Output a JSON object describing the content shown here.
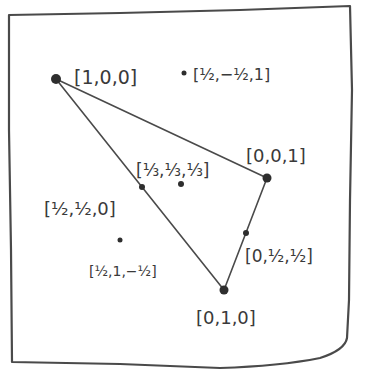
{
  "diagram": {
    "type": "projective-plane-triangle-sketch",
    "style": "hand-drawn",
    "colors": {
      "background": "#ffffff",
      "ink": "#3a3a3a",
      "frame": "#4a4a4a"
    },
    "triangle": {
      "vertices": [
        "[1,0,0]",
        "[0,0,1]",
        "[0,1,0]"
      ]
    },
    "points": [
      {
        "id": "v100",
        "label": "[1,0,0]",
        "x": 56,
        "y": 79,
        "r": 5,
        "label_x": 74,
        "label_y": 84,
        "role": "vertex"
      },
      {
        "id": "v001",
        "label": "[0,0,1]",
        "x": 267,
        "y": 178,
        "r": 4.5,
        "label_x": 246,
        "label_y": 162,
        "role": "vertex"
      },
      {
        "id": "v010",
        "label": "[0,1,0]",
        "x": 224,
        "y": 290,
        "r": 4.5,
        "label_x": 196,
        "label_y": 324,
        "role": "vertex"
      },
      {
        "id": "m110",
        "label": "[½,½,0]",
        "x": 142,
        "y": 187,
        "r": 3,
        "label_x": 44,
        "label_y": 215,
        "role": "edge-midpoint"
      },
      {
        "id": "m011",
        "label": "[0,½,½]",
        "x": 246,
        "y": 233,
        "r": 3,
        "label_x": 245,
        "label_y": 262,
        "role": "edge-midpoint"
      },
      {
        "id": "c111",
        "label": "[⅓,⅓,⅓]",
        "x": 181,
        "y": 184,
        "r": 3,
        "label_x": 136,
        "label_y": 176,
        "role": "centroid"
      },
      {
        "id": "p1m1",
        "label": "[½,−½,1]",
        "x": 184,
        "y": 73,
        "r": 2.5,
        "label_x": 193,
        "label_y": 80,
        "role": "exterior"
      },
      {
        "id": "p11m",
        "label": "[½,1,−½]",
        "x": 120,
        "y": 240,
        "r": 2.5,
        "label_x": 89,
        "label_y": 276,
        "role": "exterior"
      }
    ],
    "labels": {
      "v100": "[1,0,0]",
      "v001": "[0,0,1]",
      "v010": "[0,1,0]",
      "m110": "[½,½,0]",
      "m011": "[0,½,½]",
      "c111": "[⅓,⅓,⅓]",
      "p1m1": "[½,−½,1]",
      "p11m": "[½,1,−½]"
    }
  }
}
